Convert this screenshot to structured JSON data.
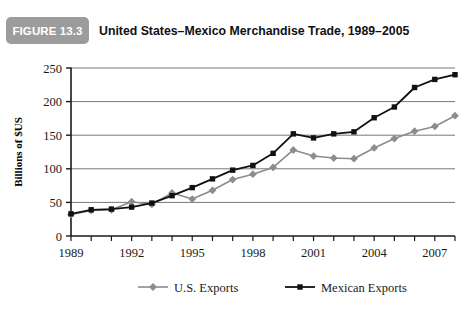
{
  "header": {
    "badge_label": "FIGURE 13.3",
    "title": "United States–Mexico Merchandise Trade, 1989–2005",
    "badge_color": "#9c9c9c",
    "badge_text_color": "#ffffff"
  },
  "chart_data": {
    "type": "line",
    "title": "United States–Mexico Merchandise Trade, 1989–2005",
    "xlabel": "",
    "ylabel": "Billions of $US",
    "ylim": [
      0,
      250
    ],
    "xlim": [
      1989,
      2008
    ],
    "yticks": [
      0,
      50,
      100,
      150,
      200,
      250
    ],
    "ytick_labels": [
      "0",
      "50",
      "100",
      "150",
      "200",
      "250"
    ],
    "xticks": [
      1989,
      1990,
      1991,
      1992,
      1993,
      1994,
      1995,
      1996,
      1997,
      1998,
      1999,
      2000,
      2001,
      2002,
      2003,
      2004,
      2005,
      2006,
      2007,
      2008
    ],
    "xtick_labels_shown": [
      "1989",
      "1992",
      "1995",
      "1998",
      "2001",
      "2004",
      "2007"
    ],
    "xtick_labels_values": [
      1989,
      1992,
      1995,
      1998,
      2001,
      2004,
      2007
    ],
    "grid": "horizontal",
    "legend_position": "bottom",
    "x": [
      1989,
      1990,
      1991,
      1992,
      1993,
      1994,
      1995,
      1996,
      1997,
      1998,
      1999,
      2000,
      2001,
      2002,
      2003,
      2004,
      2005,
      2006,
      2007,
      2008
    ],
    "series": [
      {
        "name": "U.S. Exports",
        "color": "#8c8c8c",
        "marker": "diamond",
        "values": [
          32,
          38,
          39,
          51,
          47,
          64,
          55,
          68,
          84,
          92,
          102,
          128,
          119,
          116,
          115,
          131,
          145,
          156,
          163,
          179
        ]
      },
      {
        "name": "Mexican Exports",
        "color": "#111111",
        "marker": "square",
        "values": [
          33,
          39,
          40,
          43,
          49,
          60,
          72,
          85,
          98,
          105,
          123,
          152,
          146,
          152,
          155,
          176,
          192,
          221,
          233,
          240
        ]
      }
    ]
  },
  "legend": {
    "items": [
      {
        "label": "U.S. Exports",
        "color": "#8c8c8c",
        "marker": "diamond"
      },
      {
        "label": "Mexican Exports",
        "color": "#111111",
        "marker": "square"
      }
    ]
  }
}
